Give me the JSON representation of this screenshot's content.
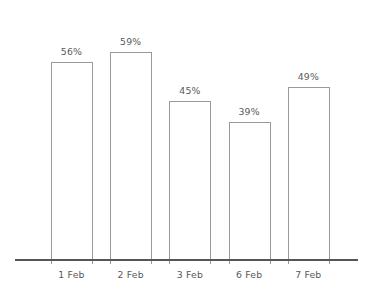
{
  "chart_data": {
    "type": "bar",
    "title": "",
    "subtitle": "",
    "xlabel": "",
    "ylabel": "",
    "categories": [
      "1 Feb",
      "2 Feb",
      "3 Feb",
      "6 Feb",
      "7 Feb"
    ],
    "values": [
      56,
      59,
      45,
      39,
      49
    ],
    "value_labels": [
      "56%",
      "59%",
      "45%",
      "39%",
      "49%"
    ],
    "unit": "%",
    "ylim": [
      0,
      68
    ],
    "grid": false,
    "legend": null,
    "legend_position": "none",
    "annotations": [],
    "series": [
      {
        "name": "",
        "values": [
          56,
          59,
          45,
          39,
          49
        ]
      }
    ]
  },
  "style": {
    "background": "#ffffff",
    "bar_fill": "#ffffff",
    "bar_stroke": "#9a9a9a",
    "axis_color": "#565656",
    "text_color": "#595959"
  },
  "axis": {
    "baseline_label": "category-axis"
  }
}
